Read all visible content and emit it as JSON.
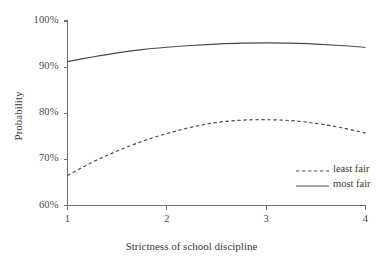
{
  "chart_data": {
    "type": "line",
    "title": "",
    "xlabel": "Strictness of school discipline",
    "ylabel": "Probability",
    "xlim": [
      1,
      4
    ],
    "ylim": [
      60,
      100
    ],
    "grid": false,
    "legend_position": "inside-bottom-right",
    "xticks": [
      "1",
      "2",
      "3",
      "4"
    ],
    "xtick_values": [
      1,
      2,
      3,
      4
    ],
    "yticks": [
      "60%",
      "70%",
      "80%",
      "90%",
      "100%"
    ],
    "ytick_values": [
      60,
      70,
      80,
      90,
      100
    ],
    "x": [
      1.0,
      1.25,
      1.5,
      1.75,
      2.0,
      2.25,
      2.5,
      2.75,
      3.0,
      3.25,
      3.5,
      3.75,
      4.0
    ],
    "series": [
      {
        "name": "least fair",
        "style": "dashed",
        "color": "#4a4a4a",
        "values": [
          66.5,
          69.4,
          71.8,
          73.9,
          75.6,
          77.0,
          78.0,
          78.5,
          78.6,
          78.4,
          77.8,
          76.9,
          75.7
        ]
      },
      {
        "name": "most fair",
        "style": "solid",
        "color": "#4a4a4a",
        "values": [
          91.2,
          92.2,
          93.1,
          93.8,
          94.3,
          94.7,
          95.0,
          95.2,
          95.25,
          95.2,
          95.0,
          94.7,
          94.3
        ]
      }
    ]
  },
  "legend": {
    "items": [
      {
        "label": "least fair",
        "style": "dashed"
      },
      {
        "label": "most fair",
        "style": "solid"
      }
    ]
  },
  "axes": {
    "x_title": "Strictness of school discipline",
    "y_title": "Probability"
  },
  "colors": {
    "background": "#ffffff",
    "axis": "#6e6e6e",
    "line": "#4a4a4a",
    "text": "#3a3a3a"
  }
}
